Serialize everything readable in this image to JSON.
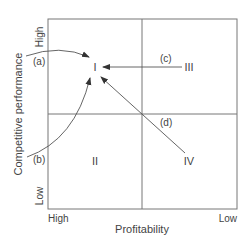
{
  "diagram": {
    "x_axis": {
      "label": "Profitability",
      "left_tick": "High",
      "right_tick": "Low"
    },
    "y_axis": {
      "label": "Competitive performance",
      "top_tick": "High",
      "bottom_tick": "Low"
    },
    "quadrants": {
      "top_left": "I",
      "top_right": "III",
      "bottom_left": "II",
      "bottom_right": "IV"
    },
    "paths": [
      {
        "id": "a",
        "label": "(a)",
        "to": "I"
      },
      {
        "id": "b",
        "label": "(b)",
        "to": "I"
      },
      {
        "id": "c",
        "label": "(c)",
        "from": "III",
        "to": "I"
      },
      {
        "id": "d",
        "label": "(d)",
        "from": "IV",
        "to": "I"
      }
    ],
    "colors": {
      "line": "#555555",
      "text": "#444444",
      "background": "#ffffff"
    }
  }
}
